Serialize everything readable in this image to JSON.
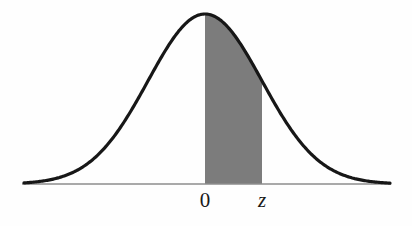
{
  "figure": {
    "name": "standard-normal-distribution-curve",
    "background_color": "#fefefe",
    "width": 412,
    "height": 226
  },
  "curve": {
    "name": "bell-curve",
    "stroke_color": "#171717",
    "stroke_width": 3.2,
    "peak_x": 205,
    "peak_y": 14,
    "left_tail_x": 24,
    "right_tail_x": 390,
    "tail_y": 176
  },
  "axis": {
    "name": "horizontal-axis",
    "color": "#8d8d8d",
    "stroke_width": 1.6,
    "y": 184,
    "x_start": 22,
    "x_end": 391
  },
  "shaded_region": {
    "name": "probability-area",
    "fill_color": "#7c7c7c",
    "left_x": 205,
    "right_x": 262,
    "right_top_y": 73,
    "bottom_y": 184
  },
  "labels": [
    {
      "text": "0",
      "x": 205,
      "y": 190,
      "italic": false,
      "name": "axis-label-zero"
    },
    {
      "text": "z",
      "x": 262,
      "y": 190,
      "italic": true,
      "name": "axis-label-z"
    }
  ],
  "chart_data": {
    "type": "area",
    "title": "",
    "subtitle": "",
    "xlabel": "",
    "ylabel": "",
    "grid": false,
    "legend": null,
    "annotations": [
      "0",
      "z"
    ],
    "distribution": "standard normal",
    "mean": 0,
    "sd": 1,
    "shaded_interval": [
      0,
      1
    ],
    "shaded_interval_labels": [
      "0",
      "z"
    ],
    "xlim": [
      -3.4,
      3.4
    ],
    "ylim": [
      0,
      0.42
    ],
    "x": [
      -3.4,
      -3.2,
      -3.0,
      -2.8,
      -2.6,
      -2.4,
      -2.2,
      -2.0,
      -1.8,
      -1.6,
      -1.4,
      -1.2,
      -1.0,
      -0.8,
      -0.6,
      -0.4,
      -0.2,
      0.0,
      0.2,
      0.4,
      0.6,
      0.8,
      1.0,
      1.2,
      1.4,
      1.6,
      1.8,
      2.0,
      2.2,
      2.4,
      2.6,
      2.8,
      3.0,
      3.2,
      3.4
    ],
    "values": [
      0.001,
      0.002,
      0.004,
      0.008,
      0.014,
      0.022,
      0.035,
      0.054,
      0.079,
      0.111,
      0.15,
      0.194,
      0.242,
      0.29,
      0.333,
      0.368,
      0.391,
      0.399,
      0.391,
      0.368,
      0.333,
      0.29,
      0.242,
      0.194,
      0.15,
      0.111,
      0.079,
      0.054,
      0.035,
      0.022,
      0.014,
      0.008,
      0.004,
      0.002,
      0.001
    ]
  }
}
